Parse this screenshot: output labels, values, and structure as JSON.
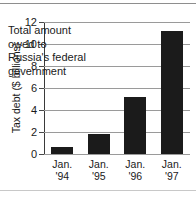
{
  "figure": {
    "ylabel": "Tax debt ($ billions)",
    "annotation_lines": [
      "Total amount",
      "owed to",
      "Russia's federal",
      "government"
    ],
    "annotation_text": "Total amount owed to Russia's federal government",
    "bar_color": "#1b1b1b",
    "grid_color": "#9a9a9a",
    "axis_color": "#3a3a3a",
    "background": "#ffffff"
  },
  "chart_data": {
    "type": "bar",
    "title": "",
    "subtitle": "",
    "xlabel": "",
    "ylabel": "Tax debt ($ billions)",
    "categories": [
      "Jan. '94",
      "Jan. '95",
      "Jan. '96",
      "Jan. '97"
    ],
    "category_lines": [
      [
        "Jan.",
        "'94"
      ],
      [
        "Jan.",
        "'95"
      ],
      [
        "Jan.",
        "'96"
      ],
      [
        "Jan.",
        "'97"
      ]
    ],
    "values": [
      0.6,
      1.8,
      5.2,
      11.2
    ],
    "ylim": [
      0,
      12
    ],
    "yticks": [
      0,
      2,
      4,
      6,
      8,
      10,
      12
    ],
    "ytick_labels": [
      "0",
      "2",
      "4",
      "6",
      "8",
      "10",
      "12"
    ],
    "grid": true,
    "grid_axis": "y",
    "legend": false,
    "legend_position": "none",
    "annotations": [
      {
        "text": "Total amount owed to Russia's federal government",
        "target": "series"
      }
    ]
  }
}
